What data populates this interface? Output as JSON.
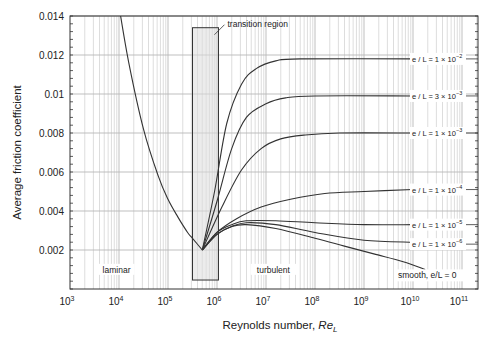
{
  "chart_data": {
    "type": "line",
    "title": "",
    "xlabel": "Reynolds number, Re_L",
    "xlabel_main": "Reynolds number, ",
    "xlabel_italic": "Re",
    "xlabel_sub": "L",
    "ylabel": "Average friction coefficient",
    "xscale": "log",
    "xlim": [
      1000,
      215443469003
    ],
    "ylim": [
      0,
      0.014
    ],
    "x_ticks": [
      {
        "exp": 3,
        "label": "10",
        "sup": "3"
      },
      {
        "exp": 4,
        "label": "10",
        "sup": "4"
      },
      {
        "exp": 5,
        "label": "10",
        "sup": "5"
      },
      {
        "exp": 6,
        "label": "10",
        "sup": "6"
      },
      {
        "exp": 7,
        "label": "10",
        "sup": "7"
      },
      {
        "exp": 8,
        "label": "10",
        "sup": "8"
      },
      {
        "exp": 9,
        "label": "10",
        "sup": "9"
      },
      {
        "exp": 10,
        "label": "10",
        "sup": "10"
      },
      {
        "exp": 11,
        "label": "10",
        "sup": "11"
      }
    ],
    "y_ticks": [
      {
        "value": 0.002,
        "label": "0.002"
      },
      {
        "value": 0.004,
        "label": "0.004"
      },
      {
        "value": 0.006,
        "label": "0.006"
      },
      {
        "value": 0.008,
        "label": "0.008"
      },
      {
        "value": 0.01,
        "label": "0.01"
      },
      {
        "value": 0.012,
        "label": "0.012"
      },
      {
        "value": 0.014,
        "label": "0.014"
      }
    ],
    "grid": true,
    "annotations": [
      {
        "text": "transition region",
        "x_log": 6.6,
        "y": 0.0137
      },
      {
        "text": "laminar",
        "x_log": 3.95,
        "y": 0.00088
      },
      {
        "text": "turbulent",
        "x_log": 7.15,
        "y": 0.00088
      }
    ],
    "transition_region": {
      "x_start_log": 5.5,
      "x_end_log": 6.03,
      "y_bottom": 0.00046,
      "y_top": 0.0134
    },
    "series": [
      {
        "name": "laminar",
        "label": "",
        "points_log": [
          [
            4.0,
            0.0145
          ],
          [
            4.2,
            0.0116
          ],
          [
            4.5,
            0.0082
          ],
          [
            4.8,
            0.0058
          ],
          [
            5.0,
            0.0046
          ],
          [
            5.2,
            0.0037
          ],
          [
            5.4,
            0.0029
          ],
          [
            5.5,
            0.0026
          ],
          [
            5.7,
            0.002
          ]
        ]
      },
      {
        "name": "e/L = 1e-2",
        "label_main": "e / L = 1 × 10",
        "label_sup": "−2",
        "label_y": 0.0118,
        "points_log": [
          [
            5.7,
            0.002
          ],
          [
            5.95,
            0.005
          ],
          [
            6.2,
            0.0085
          ],
          [
            6.5,
            0.0105
          ],
          [
            6.8,
            0.0113
          ],
          [
            7.2,
            0.0117
          ],
          [
            7.7,
            0.0118
          ],
          [
            10.0,
            0.0118
          ]
        ]
      },
      {
        "name": "e/L = 3e-3",
        "label_main": "e / L = 3 × 10",
        "label_sup": "−3",
        "label_y": 0.0099,
        "points_log": [
          [
            5.7,
            0.002
          ],
          [
            6.0,
            0.0045
          ],
          [
            6.3,
            0.0072
          ],
          [
            6.6,
            0.0088
          ],
          [
            7.0,
            0.0095
          ],
          [
            7.4,
            0.0098
          ],
          [
            8.0,
            0.0099
          ],
          [
            10.0,
            0.0099
          ]
        ]
      },
      {
        "name": "e/L = 1e-3",
        "label_main": "e / L = 1 × 10",
        "label_sup": "−3",
        "label_y": 0.008,
        "points_log": [
          [
            5.7,
            0.002
          ],
          [
            6.1,
            0.0042
          ],
          [
            6.5,
            0.0061
          ],
          [
            6.9,
            0.0072
          ],
          [
            7.3,
            0.0077
          ],
          [
            7.8,
            0.0079
          ],
          [
            8.5,
            0.008
          ],
          [
            10.0,
            0.008
          ]
        ]
      },
      {
        "name": "e/L = 1e-4",
        "label_main": "e / L = 1 × 10",
        "label_sup": "−4",
        "label_y": 0.0051,
        "points_log": [
          [
            5.7,
            0.002
          ],
          [
            6.0,
            0.0029
          ],
          [
            6.4,
            0.0036
          ],
          [
            6.9,
            0.0042
          ],
          [
            7.5,
            0.0046
          ],
          [
            8.2,
            0.0049
          ],
          [
            9.0,
            0.005
          ],
          [
            10.0,
            0.0051
          ]
        ]
      },
      {
        "name": "e/L = 1e-5",
        "label_main": "e / L = 1 × 10",
        "label_sup": "−5",
        "label_y": 0.0033,
        "points_log": [
          [
            5.7,
            0.002
          ],
          [
            6.0,
            0.0029
          ],
          [
            6.3,
            0.0033
          ],
          [
            6.6,
            0.0035
          ],
          [
            7.2,
            0.0035
          ],
          [
            8.0,
            0.0034
          ],
          [
            9.0,
            0.0033
          ],
          [
            10.0,
            0.0033
          ]
        ]
      },
      {
        "name": "e/L = 1e-6",
        "label_main": "e / L = 1 × 10",
        "label_sup": "−6",
        "label_y": 0.0023,
        "points_log": [
          [
            5.7,
            0.002
          ],
          [
            6.0,
            0.0028
          ],
          [
            6.3,
            0.0032
          ],
          [
            6.6,
            0.0034
          ],
          [
            7.2,
            0.0033
          ],
          [
            8.0,
            0.0029
          ],
          [
            9.0,
            0.0025
          ],
          [
            10.0,
            0.0024
          ]
        ]
      },
      {
        "name": "smooth, e/L = 0",
        "label_main": "smooth, e/L = 0",
        "label_sup": "",
        "label_y": 0.0007,
        "points_log": [
          [
            5.7,
            0.002
          ],
          [
            6.0,
            0.0028
          ],
          [
            6.3,
            0.0032
          ],
          [
            6.6,
            0.0033
          ],
          [
            7.2,
            0.0031
          ],
          [
            8.0,
            0.0026
          ],
          [
            8.6,
            0.0022
          ],
          [
            9.2,
            0.0018
          ],
          [
            9.8,
            0.0014
          ],
          [
            10.25,
            0.001
          ]
        ]
      }
    ]
  },
  "colors": {
    "curve": "#333333",
    "axis": "#333333",
    "grid_major": "#b8b8b8",
    "grid_minor": "#cfcfcf",
    "transition_fill": "#dcdcdc",
    "transition_stroke": "#333333"
  }
}
